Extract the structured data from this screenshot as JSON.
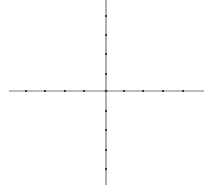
{
  "diagram": {
    "type": "coordinate-plane",
    "background": "#ffffff",
    "axis_color": "#7a7a7a",
    "tick_color": "#3a3a3a",
    "origin": {
      "x": 106,
      "y": 91
    },
    "x_axis": {
      "x1": 9,
      "x2": 204,
      "y": 91,
      "ticks": [
        26,
        45,
        65,
        84,
        124,
        143,
        163,
        183
      ]
    },
    "y_axis": {
      "x": 106,
      "y1": 0,
      "y2": 185,
      "ticks": [
        16,
        35,
        54,
        74,
        111,
        130,
        150,
        169
      ]
    },
    "tick_count_per_half": 4,
    "labels": []
  }
}
